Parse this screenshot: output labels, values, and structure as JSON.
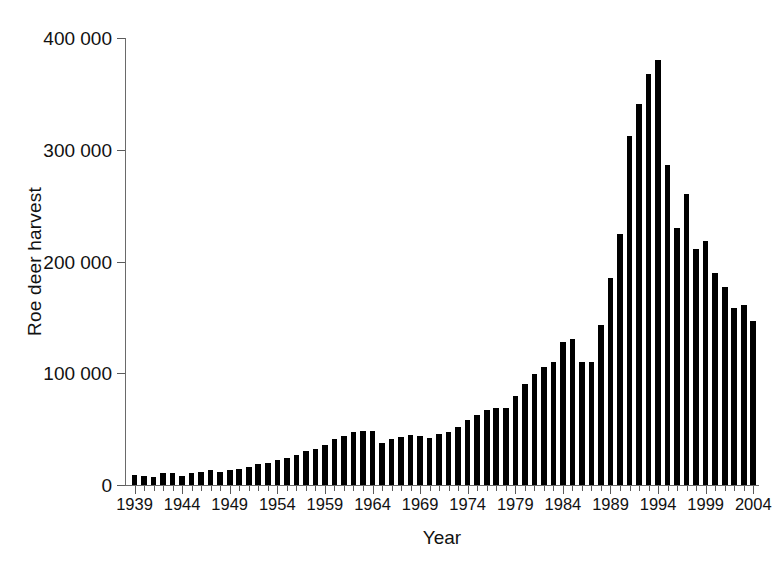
{
  "chart_data": {
    "type": "bar",
    "title": "",
    "subtitle": "",
    "xlabel": "Year",
    "ylabel": "Roe deer harvest",
    "xlim": [
      1938.5,
      2004.5
    ],
    "ylim": [
      0,
      400000
    ],
    "grid": false,
    "legend": null,
    "y_ticks": [
      0,
      100000,
      200000,
      300000,
      400000
    ],
    "y_tick_labels": [
      "0",
      "100 000",
      "200 000",
      "300 000",
      "400 000"
    ],
    "x_ticks": [
      1939,
      1944,
      1949,
      1954,
      1959,
      1964,
      1969,
      1974,
      1979,
      1984,
      1989,
      1994,
      1999,
      2004
    ],
    "x_tick_labels": [
      "1939",
      "1944",
      "1949",
      "1954",
      "1959",
      "1964",
      "1969",
      "1974",
      "1979",
      "1984",
      "1989",
      "1994",
      "1999",
      "2004"
    ],
    "x_minor_tick_interval": 1,
    "bar_color": "#000000",
    "categories": [
      1939,
      1940,
      1941,
      1942,
      1943,
      1944,
      1945,
      1946,
      1947,
      1948,
      1949,
      1950,
      1951,
      1952,
      1953,
      1954,
      1955,
      1956,
      1957,
      1958,
      1959,
      1960,
      1961,
      1962,
      1963,
      1964,
      1965,
      1966,
      1967,
      1968,
      1969,
      1970,
      1971,
      1972,
      1973,
      1974,
      1975,
      1976,
      1977,
      1978,
      1979,
      1980,
      1981,
      1982,
      1983,
      1984,
      1985,
      1986,
      1987,
      1988,
      1989,
      1990,
      1991,
      1992,
      1993,
      1994,
      1995,
      1996,
      1997,
      1998,
      1999,
      2000,
      2001,
      2002,
      2003,
      2004
    ],
    "values": [
      9000,
      8500,
      7500,
      11000,
      11000,
      8000,
      11000,
      12000,
      13000,
      12000,
      13000,
      14000,
      16000,
      19000,
      20000,
      22000,
      24000,
      27000,
      30000,
      32000,
      36000,
      41000,
      44000,
      47000,
      48000,
      48000,
      38000,
      41000,
      43000,
      45000,
      44000,
      42000,
      46000,
      47000,
      52000,
      58000,
      63000,
      67000,
      69000,
      69000,
      80000,
      90000,
      99000,
      106000,
      110000,
      128000,
      131000,
      110000,
      110000,
      143000,
      185000,
      225000,
      312000,
      341000,
      368000,
      380000,
      286000,
      230000,
      260000,
      211000,
      218000,
      190000,
      177000,
      158000,
      161000,
      147000
    ]
  },
  "axes": {
    "y_title": "Roe deer harvest",
    "x_title": "Year"
  }
}
